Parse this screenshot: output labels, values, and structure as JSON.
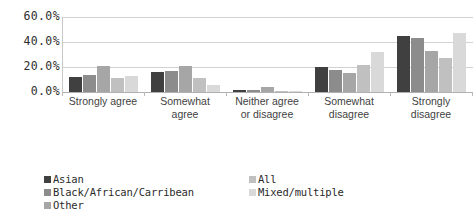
{
  "chart_data": {
    "type": "bar",
    "title": "",
    "xlabel": "",
    "ylabel": "",
    "ylim": [
      0,
      60
    ],
    "ytick_labels": [
      "60.0%",
      "40.0%",
      "20.0%",
      "0.0%"
    ],
    "ytick_values": [
      60,
      40,
      20,
      0
    ],
    "grid": true,
    "legend_position": "bottom",
    "categories": [
      "Strongly agree",
      "Somewhat agree",
      "Neither agree or disagree",
      "Somewhat disagree",
      "Strongly disagree"
    ],
    "category_lines": [
      [
        "Strongly agree"
      ],
      [
        "Somewhat",
        "agree"
      ],
      [
        "Neither agree",
        "or disagree"
      ],
      [
        "Somewhat",
        "disagree"
      ],
      [
        "Strongly",
        "disagree"
      ]
    ],
    "series": [
      {
        "name": "Asian",
        "color": "#404040",
        "values": [
          12,
          16,
          1.5,
          20,
          45
        ]
      },
      {
        "name": "Black/African/Carribean",
        "color": "#8c8c8c",
        "values": [
          14,
          17,
          2.0,
          18,
          43
        ]
      },
      {
        "name": "Other",
        "color": "#a6a6a6",
        "values": [
          21,
          21,
          4.0,
          15,
          33
        ]
      },
      {
        "name": "All",
        "color": "#c0c0c0",
        "values": [
          11,
          11,
          1.0,
          22,
          27
        ]
      },
      {
        "name": "Mixed/multiple",
        "color": "#d9d9d9",
        "values": [
          13,
          6,
          0.5,
          32,
          47
        ]
      }
    ]
  },
  "legend": {
    "left_column": [
      "Asian",
      "Black/African/Carribean",
      "Other"
    ],
    "right_column": [
      "All",
      "Mixed/multiple"
    ]
  }
}
